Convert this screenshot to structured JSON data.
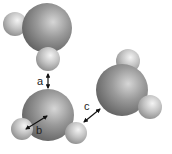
{
  "diagram": {
    "labels": {
      "a": "a",
      "b": "b",
      "c": "c"
    },
    "molecules": [
      {
        "name": "water-top",
        "oxygen": {
          "cx": 47,
          "cy": 28,
          "r": 25
        },
        "hydrogens": [
          {
            "cx": 15,
            "cy": 24,
            "r": 12
          },
          {
            "cx": 48,
            "cy": 59,
            "r": 12
          }
        ]
      },
      {
        "name": "water-bottom-left",
        "oxygen": {
          "cx": 48,
          "cy": 115,
          "r": 26
        },
        "hydrogens": [
          {
            "cx": 22,
            "cy": 129,
            "r": 11
          },
          {
            "cx": 76,
            "cy": 133,
            "r": 11
          }
        ]
      },
      {
        "name": "water-right",
        "oxygen": {
          "cx": 122,
          "cy": 90,
          "r": 26
        },
        "hydrogens": [
          {
            "cx": 128,
            "cy": 61,
            "r": 12
          },
          {
            "cx": 150,
            "cy": 107,
            "r": 12
          }
        ]
      }
    ],
    "colors": {
      "oxygen": "#8a8a8a",
      "hydrogen": "#c8c8c8",
      "arrow": "#111111"
    }
  }
}
